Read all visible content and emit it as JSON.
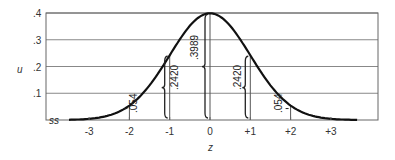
{
  "chart_data": {
    "type": "line",
    "title": "",
    "xlabel": "z",
    "ylabel": "u",
    "xlim": [
      -3.6,
      4.2
    ],
    "ylim": [
      0,
      0.4
    ],
    "x_ticks": [
      "-3",
      "-2",
      "-1",
      "0",
      "+1",
      "+2",
      "+3"
    ],
    "y_ticks": [
      ".1",
      ".2",
      ".3",
      ".4"
    ],
    "grid": "horizontal",
    "series": [
      {
        "name": "standard normal density",
        "x": [
          -3.5,
          -3,
          -2.5,
          -2,
          -1.5,
          -1,
          -0.5,
          0,
          0.5,
          1,
          1.5,
          2,
          2.5,
          3,
          3.5
        ],
        "values": [
          0.0009,
          0.0044,
          0.0175,
          0.054,
          0.1295,
          0.242,
          0.3521,
          0.3989,
          0.3521,
          0.242,
          0.1295,
          0.054,
          0.0175,
          0.0044,
          0.0009
        ]
      }
    ],
    "annotations": [
      {
        "x": "-2",
        "label": ".054"
      },
      {
        "x": "-1",
        "label": ".2420"
      },
      {
        "x": "0",
        "label": ".3989"
      },
      {
        "x": "+1",
        "label": ".2420"
      },
      {
        "x": "+2",
        "label": ".054"
      }
    ]
  }
}
